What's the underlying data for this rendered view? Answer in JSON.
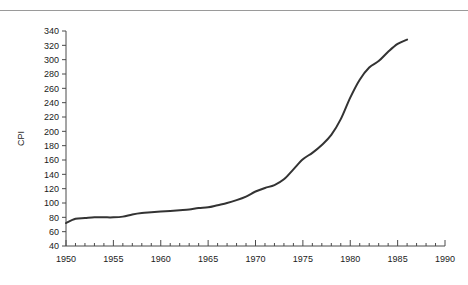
{
  "header": {
    "clipped_caption": "···   ···",
    "rule_color": "#9a9a9a"
  },
  "chart_data": {
    "type": "line",
    "title": "",
    "xlabel": "",
    "ylabel": "CPI",
    "xlim": [
      1950,
      1990
    ],
    "ylim": [
      40,
      340
    ],
    "grid": false,
    "legend": null,
    "line_color": "#333333",
    "x_major_ticks": [
      1950,
      1955,
      1960,
      1965,
      1970,
      1975,
      1980,
      1985,
      1990
    ],
    "x_tick_labels": [
      "1950",
      "1955",
      "1960",
      "1965",
      "1970",
      "1975",
      "1980",
      "1985",
      "1990"
    ],
    "x_minor_tick_step": 1,
    "y_ticks": [
      40,
      60,
      80,
      100,
      120,
      140,
      160,
      180,
      200,
      220,
      240,
      260,
      280,
      300,
      320,
      340
    ],
    "y_tick_labels": [
      "40",
      "60",
      "80",
      "100",
      "120",
      "140",
      "160",
      "180",
      "200",
      "220",
      "240",
      "260",
      "280",
      "300",
      "320",
      "340"
    ],
    "series": [
      {
        "name": "CPI",
        "x": [
          1950,
          1951,
          1952,
          1953,
          1954,
          1955,
          1956,
          1957,
          1958,
          1959,
          1960,
          1961,
          1962,
          1963,
          1964,
          1965,
          1966,
          1967,
          1968,
          1969,
          1970,
          1971,
          1972,
          1973,
          1974,
          1975,
          1976,
          1977,
          1978,
          1979,
          1980,
          1981,
          1982,
          1983,
          1984,
          1985,
          1986
        ],
        "values": [
          72,
          78,
          79,
          80,
          80,
          80,
          81,
          84,
          86,
          87,
          88,
          89,
          90,
          91,
          93,
          94,
          97,
          100,
          104,
          109,
          116,
          121,
          125,
          133,
          147,
          161,
          170,
          181,
          195,
          217,
          247,
          272,
          289,
          298,
          311,
          322,
          328
        ]
      }
    ]
  }
}
